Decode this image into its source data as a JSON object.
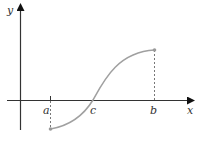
{
  "figure": {
    "type": "function-graph",
    "axes": {
      "x_label": "x",
      "y_label": "y"
    },
    "points": {
      "a": "a",
      "b": "b",
      "c": "c"
    },
    "colors": {
      "axis": "#333333",
      "curve": "#a0a0a0",
      "dashed": "#555555",
      "endpoint": "#9a9a9a"
    }
  }
}
